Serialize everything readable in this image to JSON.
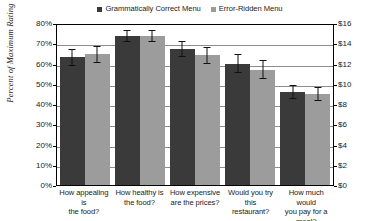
{
  "chart_data": {
    "type": "bar",
    "title": "",
    "xlabel": "",
    "ylabel": "Percent of Maximum Rating",
    "ylabel_right": "",
    "categories": [
      "How appealing is the food?",
      "How healthy is the food?",
      "How expensive are the prices?",
      "Would you try this restaurant?",
      "How much would you pay for a meal?"
    ],
    "category_lines": [
      [
        "How appealing is",
        "the food?"
      ],
      [
        "How healthy is",
        "the food?"
      ],
      [
        "How expensive",
        "are the prices?"
      ],
      [
        "Would you try this",
        "restaurant?"
      ],
      [
        "How much would",
        "you pay for a meal?"
      ]
    ],
    "series": [
      {
        "name": "Grammatically Correct Menu",
        "color": "#3a3a3a",
        "values": [
          63,
          73.5,
          67,
          60,
          46
        ],
        "errors": [
          4,
          3,
          4,
          4.5,
          3.5
        ]
      },
      {
        "name": "Error-Ridden Menu",
        "color": "#9c9c9c",
        "values": [
          64.5,
          73.5,
          64,
          57,
          45
        ],
        "errors": [
          4,
          3,
          4,
          4.5,
          3.5
        ]
      }
    ],
    "ylim": [
      0,
      80
    ],
    "yticks": [
      "0%",
      "10%",
      "20%",
      "30%",
      "40%",
      "50%",
      "60%",
      "70%",
      "80%"
    ],
    "ylim_right": [
      0,
      16
    ],
    "yticks_right": [
      "$0",
      "$2",
      "$4",
      "$6",
      "$8",
      "$10",
      "$12",
      "$14",
      "$16"
    ],
    "grid": true,
    "legend_position": "top-center",
    "note_last_category_uses_right_axis": "dollars"
  },
  "legend": {
    "items": [
      {
        "label": "Grammatically Correct Menu",
        "color": "#3a3a3a"
      },
      {
        "label": "Error-Ridden Menu",
        "color": "#9c9c9c"
      }
    ]
  }
}
